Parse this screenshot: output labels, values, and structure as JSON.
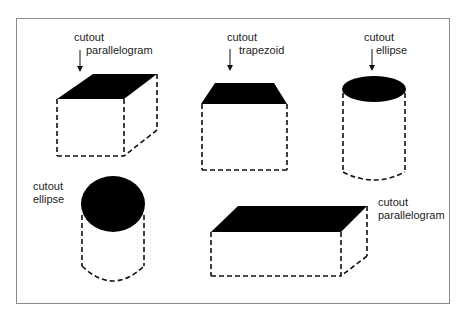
{
  "figure": {
    "shapes": [
      {
        "id": "cube",
        "label_line1": "cutout",
        "label_line2": "parallelogram",
        "top_shape": "parallelogram",
        "has_arrow": true
      },
      {
        "id": "trapezoid-box",
        "label_line1": "cutout",
        "label_line2": "trapezoid",
        "top_shape": "trapezoid",
        "has_arrow": true
      },
      {
        "id": "cylinder-tall",
        "label_line1": "cutout",
        "label_line2": "ellipse",
        "top_shape": "ellipse",
        "has_arrow": true
      },
      {
        "id": "cylinder-short",
        "label_line1": "cutout",
        "label_line2": "ellipse",
        "top_shape": "ellipse",
        "has_arrow": false
      },
      {
        "id": "flat-box",
        "label_line1": "cutout",
        "label_line2": "parallelogram",
        "top_shape": "parallelogram",
        "has_arrow": false
      }
    ],
    "colors": {
      "fill": "#000000",
      "stroke": "#111111",
      "frame": "#8a8a8a"
    }
  }
}
